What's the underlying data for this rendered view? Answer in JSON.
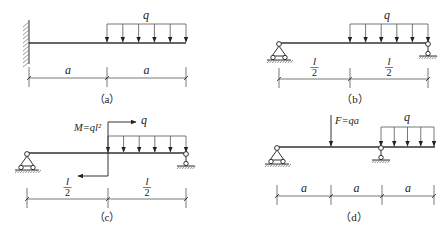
{
  "figure": {
    "panels": [
      {
        "id": "a",
        "caption": "（a）",
        "caption_pos": [
          107,
          103
        ],
        "beam": {
          "x1": 29,
          "x2": 186,
          "y": 43
        },
        "supports": [
          {
            "type": "fixed-wall",
            "x": 29,
            "y": 43,
            "ytop": 20,
            "ybot": 64
          }
        ],
        "distributed_loads": [
          {
            "label": "q",
            "x1": 107,
            "x2": 186,
            "ytop": 24,
            "arrows": 6,
            "label_pos": [
              146,
              19
            ]
          }
        ],
        "point_loads": [],
        "moments": [],
        "dimension": {
          "y": 78,
          "ticks": [
            29,
            107,
            186
          ],
          "labels": [
            "a",
            "a"
          ],
          "fraction": false
        }
      },
      {
        "id": "b",
        "caption": "（b）",
        "caption_pos": [
          355,
          103
        ],
        "beam": {
          "x1": 279,
          "x2": 428,
          "y": 43
        },
        "supports": [
          {
            "type": "pin",
            "x": 279,
            "y": 43
          },
          {
            "type": "roller",
            "x": 428,
            "y": 43
          }
        ],
        "distributed_loads": [
          {
            "label": "q",
            "x1": 350,
            "x2": 428,
            "ytop": 24,
            "arrows": 6,
            "label_pos": [
              387,
              19
            ]
          }
        ],
        "point_loads": [],
        "moments": [],
        "dimension": {
          "y": 79,
          "ticks": [
            279,
            350,
            428
          ],
          "labels": [
            "l",
            "l"
          ],
          "fraction": true,
          "denominator": "2"
        }
      },
      {
        "id": "c",
        "caption": "（c）",
        "caption_pos": [
          107,
          221
        ],
        "beam": {
          "x1": 27,
          "x2": 186,
          "y": 153
        },
        "supports": [
          {
            "type": "pin",
            "x": 27,
            "y": 153
          },
          {
            "type": "roller",
            "x": 186,
            "y": 153
          }
        ],
        "distributed_loads": [
          {
            "label": "q",
            "x1": 108,
            "x2": 186,
            "ytop": 136,
            "arrows": 6,
            "label_pos": [
              144,
              124
            ]
          }
        ],
        "point_loads": [],
        "moments": [
          {
            "label": "M=ql²",
            "x": 108,
            "ytop": 122,
            "ybot": 176,
            "top_to": 136,
            "bot_to": 78,
            "label_pos": [
              74,
              131
            ]
          }
        ],
        "dimension": {
          "y": 199,
          "ticks": [
            27,
            108,
            186
          ],
          "labels": [
            "l",
            "l"
          ],
          "fraction": true,
          "denominator": "2"
        }
      },
      {
        "id": "d",
        "caption": "（d）",
        "caption_pos": [
          354,
          221
        ],
        "beam": {
          "x1": 277,
          "x2": 435,
          "y": 147
        },
        "supports": [
          {
            "type": "pin",
            "x": 277,
            "y": 147
          },
          {
            "type": "roller",
            "x": 381,
            "y": 147
          }
        ],
        "distributed_loads": [
          {
            "label": "q",
            "x1": 381,
            "x2": 434,
            "ytop": 127,
            "arrows": 5,
            "label_pos": [
              407,
              121
            ]
          }
        ],
        "point_loads": [
          {
            "label": "F=qa",
            "x": 331,
            "ytop": 115,
            "ybot": 147,
            "label_pos": [
              335,
              124
            ]
          }
        ],
        "moments": [],
        "dimension": {
          "y": 196,
          "ticks": [
            277,
            331,
            382,
            434
          ],
          "labels": [
            "a",
            "a",
            "a"
          ],
          "fraction": false
        }
      }
    ]
  }
}
